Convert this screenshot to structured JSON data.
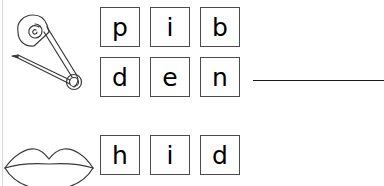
{
  "worksheet": {
    "background_color": "#ffffff",
    "tile_border_color": "#4a4a4a",
    "text_color": "#000000",
    "line_color": "#1a1a1a"
  },
  "pictures": [
    {
      "icon": "safety-pin-icon",
      "label": "safety pin",
      "row": 1
    },
    {
      "icon": "lips-icon",
      "label": "lips",
      "row": 3
    }
  ],
  "tile_rows": [
    {
      "id": "row-1",
      "letters": [
        {
          "letter": "p"
        },
        {
          "letter": "i"
        },
        {
          "letter": "b"
        }
      ]
    },
    {
      "id": "row-2",
      "letters": [
        {
          "letter": "d"
        },
        {
          "letter": "e"
        },
        {
          "letter": "n"
        }
      ]
    },
    {
      "id": "row-3",
      "letters": [
        {
          "letter": "h"
        },
        {
          "letter": "i"
        },
        {
          "letter": "d"
        }
      ]
    }
  ],
  "answer_line": {
    "value": "",
    "placeholder": ""
  }
}
